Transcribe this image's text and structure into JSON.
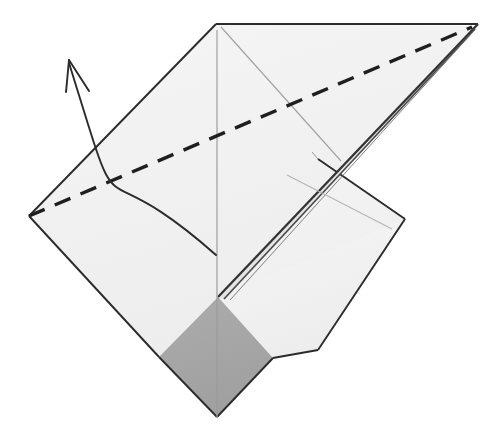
{
  "figure": {
    "canvas": {
      "width": 497,
      "height": 431
    },
    "background_color": "#ffffff"
  },
  "palette": {
    "paper_front": "#f2f2f2",
    "paper_front_shadow": "#ebebeb",
    "paper_back_gray": "#a8a8a8",
    "paper_back_gray_dark": "#9d9d9d",
    "outline": "#2b2b2b",
    "ridge_dark": "#3a3a3a",
    "crease_light": "#9a9a9a",
    "crease_faint": "#b4b4b4",
    "dashed_fold": "#1f1f1f",
    "arrow_stroke": "#2b2b2b"
  },
  "geometry": {
    "top_apex": {
      "x": 216,
      "y": 24
    },
    "right_tip": {
      "x": 478,
      "y": 24
    },
    "left_corner": {
      "x": 29,
      "y": 216
    },
    "gray_diamond": {
      "top": {
        "x": 218,
        "y": 297
      },
      "left": {
        "x": 159,
        "y": 357
      },
      "bottom": {
        "x": 217,
        "y": 417
      },
      "right": {
        "x": 273,
        "y": 358
      }
    },
    "back_flap_right_corner": {
      "x": 405,
      "y": 219
    },
    "ridge_start": {
      "x": 222,
      "y": 296
    },
    "ridge_end": {
      "x": 476,
      "y": 26
    },
    "center_line": {
      "x1": 217,
      "y1": 30,
      "x2": 217,
      "y2": 417
    }
  },
  "elements": {
    "front_sheet_label": "front paper surface",
    "back_sheet_label": "reverse side gray panel",
    "ridge_label": "folded ridge spine",
    "dashed_line_label": "valley fold line",
    "arrow_label": "fold direction arrow",
    "center_crease_label": "vertical center crease",
    "side_crease_label": "diagonal crease"
  },
  "dashed_fold": {
    "from": {
      "x": 29,
      "y": 216
    },
    "to": {
      "x": 472,
      "y": 27
    },
    "dash_pattern": "17 11",
    "stroke_width": 3.4
  },
  "arrow": {
    "tip": {
      "x": 69,
      "y": 60
    },
    "tail": {
      "x": 216,
      "y": 255
    },
    "head_left_barb": {
      "x": 66,
      "y": 92
    },
    "head_right_barb": {
      "x": 89,
      "y": 91
    },
    "curve_control_1": {
      "x": 86,
      "y": 140
    },
    "curve_control_2": {
      "x": 128,
      "y": 252
    },
    "stroke_width": 1.9
  },
  "annotations": {
    "visible_text": [],
    "note": "no printed labels or numbers appear in this figure"
  }
}
